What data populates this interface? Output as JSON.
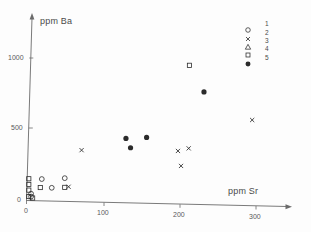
{
  "axes": {
    "ylabel": "ppm Ba",
    "xlabel": "ppm Sr",
    "x_ticks": [
      "0",
      "100",
      "200",
      "300"
    ],
    "y_ticks": [
      "0",
      "500",
      "1000"
    ],
    "origin_label": "0"
  },
  "legend": {
    "entries": [
      {
        "label": "1",
        "symbol": "open-circle"
      },
      {
        "label": "2",
        "symbol": "cross"
      },
      {
        "label": "3",
        "symbol": "open-triangle"
      },
      {
        "label": "4",
        "symbol": "open-square"
      },
      {
        "label": "5",
        "symbol": "filled-circle"
      }
    ]
  },
  "colors": {
    "ink": "#4a4a4a",
    "axis": "#6b6b6b",
    "marker": "#2b2b2b",
    "background": "#fdfdfd"
  },
  "chart_data": {
    "type": "scatter",
    "title": "",
    "xlabel": "ppm Sr",
    "ylabel": "ppm Ba",
    "xlim": [
      0,
      340
    ],
    "ylim": [
      0,
      1150
    ],
    "xticks": [
      0,
      100,
      200,
      300
    ],
    "yticks": [
      0,
      500,
      1000
    ],
    "grid": false,
    "legend_position": "top-right",
    "series": [
      {
        "name": "1",
        "symbol": "open-circle",
        "points": [
          {
            "x": 20,
            "y": 150
          },
          {
            "x": 33,
            "y": 90
          },
          {
            "x": 50,
            "y": 160
          },
          {
            "x": 6,
            "y": 45
          },
          {
            "x": 6,
            "y": 25
          }
        ]
      },
      {
        "name": "2",
        "symbol": "cross",
        "points": [
          {
            "x": 55,
            "y": 100
          },
          {
            "x": 72,
            "y": 360
          },
          {
            "x": 198,
            "y": 370
          },
          {
            "x": 212,
            "y": 390
          },
          {
            "x": 202,
            "y": 265
          },
          {
            "x": 295,
            "y": 600
          }
        ]
      },
      {
        "name": "3",
        "symbol": "open-triangle",
        "points": []
      },
      {
        "name": "4",
        "symbol": "open-square",
        "points": [
          {
            "x": 3,
            "y": 150
          },
          {
            "x": 3,
            "y": 110
          },
          {
            "x": 3,
            "y": 70
          },
          {
            "x": 3,
            "y": 25
          },
          {
            "x": 8,
            "y": 15
          },
          {
            "x": 18,
            "y": 90
          },
          {
            "x": 50,
            "y": 95
          },
          {
            "x": 213,
            "y": 975
          }
        ]
      },
      {
        "name": "5",
        "symbol": "filled-circle",
        "points": [
          {
            "x": 130,
            "y": 450
          },
          {
            "x": 136,
            "y": 385
          },
          {
            "x": 157,
            "y": 460
          },
          {
            "x": 232,
            "y": 790
          }
        ]
      }
    ]
  }
}
